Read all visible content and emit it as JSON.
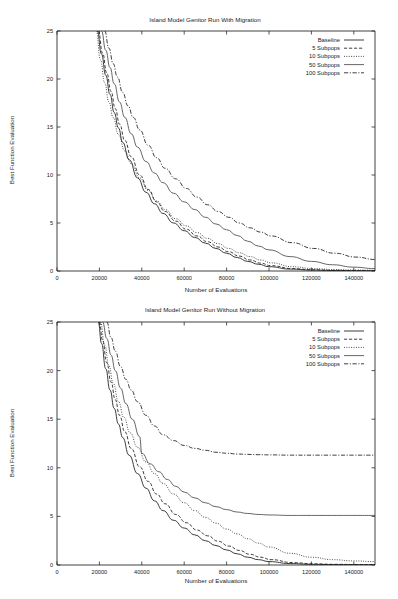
{
  "figure": {
    "background": "#ffffff",
    "ink_color": "#1a1a1a"
  },
  "chart_data": [
    {
      "id": "with-migration",
      "type": "line",
      "title": "Island Model Genitor Run With Migration",
      "xlabel": "Number of Evaluations",
      "ylabel": "Best Function Evaluation",
      "xlim": [
        0,
        150000
      ],
      "ylim": [
        0,
        25
      ],
      "xticks": [
        0,
        20000,
        40000,
        60000,
        80000,
        100000,
        120000,
        140000
      ],
      "xticklabels": [
        "0",
        "20000",
        "40000",
        "60000",
        "80000",
        "100000",
        "120000",
        "140000"
      ],
      "yticks": [
        0,
        5,
        10,
        15,
        20,
        25
      ],
      "yticklabels": [
        "0",
        "5",
        "10",
        "15",
        "20",
        "25"
      ],
      "grid": false,
      "legend_position": "top-right",
      "series": [
        {
          "name": "Baseline",
          "dash": "none",
          "color": "#1a1a1a",
          "x": [
            19000,
            21000,
            23000,
            25000,
            27000,
            29000,
            31000,
            34000,
            38000,
            42000,
            46000,
            50000,
            55000,
            60000,
            65000,
            70000,
            75000,
            80000,
            85000,
            90000,
            95000,
            100000,
            110000,
            120000,
            130000,
            140000,
            150000
          ],
          "y": [
            25.0,
            22.6,
            20.4,
            18.4,
            16.5,
            14.9,
            13.4,
            11.6,
            9.7,
            8.2,
            7.0,
            6.0,
            5.0,
            4.2,
            3.5,
            2.9,
            2.35,
            1.85,
            1.4,
            1.0,
            0.7,
            0.45,
            0.2,
            0.1,
            0.05,
            0.03,
            0.02
          ]
        },
        {
          "name": "5 Subpops",
          "dash": "dashed",
          "color": "#1a1a1a",
          "x": [
            19500,
            21500,
            23500,
            25500,
            27500,
            29500,
            32000,
            35000,
            39000,
            43000,
            47000,
            51000,
            56000,
            61000,
            66000,
            71000,
            76000,
            81000,
            86000,
            91000,
            96000,
            101000,
            111000,
            121000,
            131000,
            141000,
            150000
          ],
          "y": [
            25.0,
            22.7,
            20.6,
            18.7,
            16.9,
            15.3,
            13.6,
            11.9,
            10.0,
            8.5,
            7.2,
            6.2,
            5.2,
            4.35,
            3.65,
            3.05,
            2.5,
            2.0,
            1.55,
            1.15,
            0.82,
            0.55,
            0.25,
            0.12,
            0.07,
            0.04,
            0.03
          ]
        },
        {
          "name": "10 Subpops",
          "dash": "dotted",
          "color": "#1a1a1a",
          "x": [
            18500,
            20500,
            22500,
            24500,
            26500,
            29000,
            32000,
            35000,
            39000,
            43000,
            47000,
            51000,
            56000,
            61000,
            66000,
            71000,
            76000,
            81000,
            86000,
            91000,
            96000,
            101000,
            111000,
            121000,
            131000,
            141000,
            150000
          ],
          "y": [
            25.0,
            22.0,
            19.6,
            17.6,
            16.0,
            14.2,
            12.5,
            11.2,
            9.7,
            8.4,
            7.3,
            6.4,
            5.45,
            4.7,
            4.0,
            3.4,
            2.85,
            2.35,
            1.9,
            1.5,
            1.15,
            0.85,
            0.45,
            0.25,
            0.15,
            0.1,
            0.08
          ]
        },
        {
          "name": "50 Subpops",
          "dash": "none",
          "color": "#4a4a4a",
          "x": [
            21000,
            23000,
            25000,
            27000,
            29500,
            32000,
            35000,
            38000,
            42000,
            46000,
            50000,
            55000,
            60000,
            65000,
            70000,
            75000,
            80000,
            85000,
            90000,
            95000,
            100000,
            110000,
            120000,
            130000,
            140000,
            150000
          ],
          "y": [
            25.0,
            23.0,
            21.2,
            19.5,
            17.6,
            16.0,
            14.3,
            12.9,
            11.4,
            10.2,
            9.2,
            8.1,
            7.2,
            6.4,
            5.6,
            4.9,
            4.3,
            3.7,
            3.1,
            2.6,
            2.2,
            1.5,
            1.0,
            0.65,
            0.4,
            0.25
          ]
        },
        {
          "name": "100 Subpops",
          "dash": "dashdot",
          "color": "#1a1a1a",
          "x": [
            22500,
            24500,
            26500,
            28500,
            31000,
            33500,
            36000,
            39000,
            43000,
            47000,
            51000,
            56000,
            61000,
            66000,
            71000,
            76000,
            81000,
            86000,
            91000,
            96000,
            101000,
            111000,
            121000,
            131000,
            141000,
            150000
          ],
          "y": [
            25.0,
            23.2,
            21.6,
            20.2,
            18.6,
            17.2,
            16.0,
            14.7,
            13.1,
            11.8,
            10.7,
            9.6,
            8.6,
            7.7,
            6.9,
            6.2,
            5.6,
            5.0,
            4.5,
            4.05,
            3.65,
            2.95,
            2.35,
            1.85,
            1.45,
            1.2
          ]
        }
      ]
    },
    {
      "id": "without-migration",
      "type": "line",
      "title": "Island Model Genitor Run Without Migration",
      "xlabel": "Number of Evaluations",
      "ylabel": "Best Function Evaluation",
      "xlim": [
        0,
        150000
      ],
      "ylim": [
        0,
        25
      ],
      "xticks": [
        0,
        20000,
        40000,
        60000,
        80000,
        100000,
        120000,
        140000
      ],
      "xticklabels": [
        "0",
        "20000",
        "40000",
        "60000",
        "80000",
        "100000",
        "120000",
        "140000"
      ],
      "yticks": [
        0,
        5,
        10,
        15,
        20,
        25
      ],
      "yticklabels": [
        "0",
        "5",
        "10",
        "15",
        "20",
        "25"
      ],
      "grid": false,
      "legend_position": "top-right",
      "series": [
        {
          "name": "Baseline",
          "dash": "none",
          "color": "#1a1a1a",
          "x": [
            19500,
            21000,
            23000,
            25000,
            27000,
            29000,
            31000,
            34000,
            38000,
            42000,
            46000,
            50000,
            55000,
            60000,
            65000,
            70000,
            75000,
            80000,
            85000,
            90000,
            95000,
            100000,
            110000,
            120000,
            130000,
            140000,
            150000
          ],
          "y": [
            25.0,
            22.8,
            20.2,
            18.0,
            16.1,
            14.5,
            13.1,
            11.3,
            9.4,
            7.9,
            6.6,
            5.6,
            4.6,
            3.8,
            3.1,
            2.5,
            2.0,
            1.55,
            1.15,
            0.8,
            0.55,
            0.35,
            0.15,
            0.07,
            0.04,
            0.03,
            0.02
          ]
        },
        {
          "name": "5 Subpops",
          "dash": "dashed",
          "color": "#1a1a1a",
          "x": [
            20000,
            21500,
            23500,
            25500,
            27500,
            29500,
            32000,
            35000,
            39000,
            43000,
            47000,
            51000,
            56000,
            61000,
            66000,
            71000,
            76000,
            81000,
            86000,
            91000,
            96000,
            101000,
            111000,
            121000,
            131000,
            141000,
            150000
          ],
          "y": [
            25.0,
            23.1,
            20.8,
            18.8,
            17.0,
            15.4,
            13.7,
            12.0,
            10.1,
            8.6,
            7.3,
            6.3,
            5.2,
            4.35,
            3.6,
            3.0,
            2.45,
            1.95,
            1.5,
            1.1,
            0.8,
            0.55,
            0.25,
            0.12,
            0.07,
            0.05,
            0.04
          ]
        },
        {
          "name": "10 Subpops",
          "dash": "dotted",
          "color": "#1a1a1a",
          "x": [
            20500,
            22500,
            24500,
            26500,
            29000,
            31500,
            34500,
            38000,
            42000,
            46000,
            50000,
            55000,
            60000,
            65000,
            70000,
            75000,
            80000,
            85000,
            90000,
            95000,
            100000,
            110000,
            120000,
            130000,
            140000,
            150000
          ],
          "y": [
            25.0,
            22.6,
            20.5,
            18.7,
            16.8,
            15.2,
            13.6,
            12.1,
            10.6,
            9.4,
            8.4,
            7.3,
            6.4,
            5.6,
            4.9,
            4.3,
            3.7,
            3.2,
            2.7,
            2.25,
            1.85,
            1.2,
            0.8,
            0.55,
            0.42,
            0.35
          ]
        },
        {
          "name": "50 Subpops",
          "dash": "none",
          "color": "#4a4a4a",
          "x": [
            21500,
            23500,
            25500,
            27500,
            30000,
            32500,
            35500,
            39000,
            40000,
            44000,
            48000,
            52000,
            56000,
            60000,
            65000,
            70000,
            75000,
            80000,
            85000,
            90000,
            95000,
            100000,
            110000,
            120000,
            130000,
            140000,
            150000
          ],
          "y": [
            25.0,
            23.3,
            21.6,
            20.0,
            18.2,
            16.6,
            15.0,
            13.2,
            11.5,
            10.4,
            9.6,
            8.8,
            8.1,
            7.5,
            6.9,
            6.4,
            6.0,
            5.7,
            5.45,
            5.3,
            5.2,
            5.15,
            5.1,
            5.1,
            5.1,
            5.1,
            5.1
          ]
        },
        {
          "name": "100 Subpops",
          "dash": "dashdot",
          "color": "#1a1a1a",
          "x": [
            23500,
            25500,
            27500,
            30000,
            32500,
            35000,
            38000,
            42000,
            46000,
            50000,
            55000,
            60000,
            65000,
            70000,
            75000,
            80000,
            85000,
            90000,
            95000,
            100000,
            110000,
            120000,
            130000,
            140000,
            150000
          ],
          "y": [
            25.0,
            23.4,
            22.0,
            20.4,
            19.1,
            18.0,
            16.8,
            15.4,
            14.3,
            13.4,
            12.8,
            12.3,
            12.0,
            11.8,
            11.6,
            11.5,
            11.42,
            11.38,
            11.35,
            11.33,
            11.3,
            11.3,
            11.3,
            11.3,
            11.3
          ]
        }
      ]
    }
  ]
}
